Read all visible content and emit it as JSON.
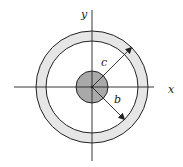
{
  "diagram": {
    "center": [
      92,
      87
    ],
    "inner_disk": {
      "radius": 16,
      "fill": "#a9a9a9"
    },
    "outer_ring": {
      "inner_radius": 46,
      "outer_radius": 56,
      "fill": "#e6e6e6"
    },
    "axes": {
      "x_label": "x",
      "y_label": "y"
    },
    "dimensions": [
      {
        "label": "c",
        "meaning": "radius to outer edge of ring",
        "direction": "upper-right"
      },
      {
        "label": "b",
        "meaning": "radius to inner edge of ring",
        "direction": "lower-right"
      }
    ],
    "colors": {
      "stroke": "#222222",
      "ring_fill": "#e6e6e6",
      "disk_fill": "#a9a9a9"
    }
  }
}
